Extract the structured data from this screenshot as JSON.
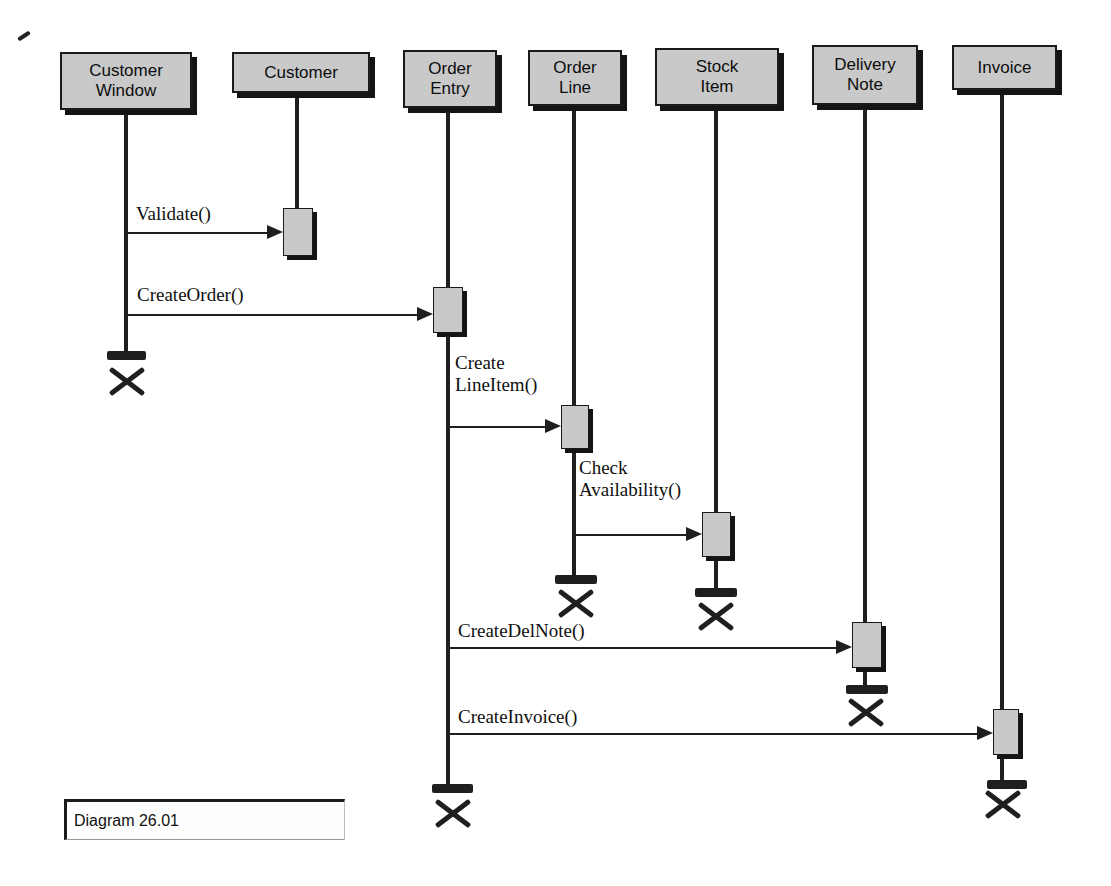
{
  "colors": {
    "line": "#1f1f1f",
    "boxfill": "#c9c9c9",
    "boxborder": "#1a1a1a",
    "shadow": "#141414"
  },
  "caption": {
    "text": "Diagram 26.01"
  },
  "actors": [
    {
      "id": "customer-window",
      "label": "Customer\nWindow",
      "box": {
        "x": 60,
        "y": 52,
        "w": 132,
        "h": 58
      },
      "lifeline": {
        "x": 126,
        "y1": 110,
        "y2": 352
      },
      "activations": [],
      "destroy": {
        "bar": {
          "x": 107,
          "y": 351,
          "w": 39,
          "h": 9
        },
        "x_mark": {
          "cx": 127,
          "cy": 382
        }
      }
    },
    {
      "id": "customer",
      "label": "Customer",
      "box": {
        "x": 232,
        "y": 52,
        "w": 138,
        "h": 41
      },
      "lifeline": {
        "x": 297,
        "y1": 93,
        "y2": 208
      },
      "activations": [
        {
          "x": 283,
          "y": 208,
          "w": 30,
          "h": 48
        }
      ],
      "destroy": null
    },
    {
      "id": "order-entry",
      "label": "Order\nEntry",
      "box": {
        "x": 403,
        "y": 50,
        "w": 94,
        "h": 58
      },
      "lifeline": {
        "x": 448,
        "y1": 108,
        "y2": 784
      },
      "activations": [
        {
          "x": 433,
          "y": 287,
          "w": 30,
          "h": 46
        }
      ],
      "destroy": {
        "bar": {
          "x": 432,
          "y": 784,
          "w": 41,
          "h": 9
        },
        "x_mark": {
          "cx": 453,
          "cy": 814
        }
      }
    },
    {
      "id": "order-line",
      "label": "Order\nLine",
      "box": {
        "x": 528,
        "y": 50,
        "w": 94,
        "h": 56
      },
      "lifeline": {
        "x": 574,
        "y1": 106,
        "y2": 575
      },
      "activations": [
        {
          "x": 561,
          "y": 405,
          "w": 28,
          "h": 44
        }
      ],
      "destroy": {
        "bar": {
          "x": 555,
          "y": 575,
          "w": 42,
          "h": 9
        },
        "x_mark": {
          "cx": 576,
          "cy": 604
        }
      }
    },
    {
      "id": "stock-item",
      "label": "Stock\nItem",
      "box": {
        "x": 655,
        "y": 48,
        "w": 124,
        "h": 58
      },
      "lifeline": {
        "x": 716,
        "y1": 106,
        "y2": 588
      },
      "activations": [
        {
          "x": 702,
          "y": 512,
          "w": 29,
          "h": 45
        }
      ],
      "destroy": {
        "bar": {
          "x": 695,
          "y": 588,
          "w": 42,
          "h": 9
        },
        "x_mark": {
          "cx": 716,
          "cy": 617
        }
      }
    },
    {
      "id": "delivery-note",
      "label": "Delivery\nNote",
      "box": {
        "x": 812,
        "y": 45,
        "w": 106,
        "h": 60
      },
      "lifeline": {
        "x": 865,
        "y1": 105,
        "y2": 685
      },
      "activations": [
        {
          "x": 852,
          "y": 622,
          "w": 30,
          "h": 46
        }
      ],
      "destroy": {
        "bar": {
          "x": 846,
          "y": 685,
          "w": 42,
          "h": 9
        },
        "x_mark": {
          "cx": 866,
          "cy": 713
        }
      }
    },
    {
      "id": "invoice",
      "label": "Invoice",
      "box": {
        "x": 952,
        "y": 45,
        "w": 105,
        "h": 45
      },
      "lifeline": {
        "x": 1002,
        "y1": 90,
        "y2": 780
      },
      "activations": [
        {
          "x": 993,
          "y": 709,
          "w": 26,
          "h": 46
        }
      ],
      "destroy": {
        "bar": {
          "x": 987,
          "y": 780,
          "w": 40,
          "h": 9
        },
        "x_mark": {
          "cx": 1003,
          "cy": 805
        }
      }
    }
  ],
  "messages": [
    {
      "id": "validate",
      "label": "Validate()",
      "from": "customer-window",
      "to": "customer",
      "x1": 128,
      "x2": 283,
      "y": 233,
      "label_x": 136,
      "label_y": 203
    },
    {
      "id": "create-order",
      "label": "CreateOrder()",
      "from": "customer-window",
      "to": "order-entry",
      "x1": 128,
      "x2": 433,
      "y": 315,
      "label_x": 137,
      "label_y": 284
    },
    {
      "id": "create-line-item",
      "label": "Create\nLineItem()",
      "from": "order-entry",
      "to": "order-line",
      "x1": 450,
      "x2": 561,
      "y": 427,
      "label_x": 455,
      "label_y": 352
    },
    {
      "id": "check-availability",
      "label": "Check\nAvailability()",
      "from": "order-line",
      "to": "stock-item",
      "x1": 576,
      "x2": 702,
      "y": 535,
      "label_x": 579,
      "label_y": 457
    },
    {
      "id": "create-del-note",
      "label": "CreateDelNote()",
      "from": "order-entry",
      "to": "delivery-note",
      "x1": 450,
      "x2": 852,
      "y": 648,
      "label_x": 458,
      "label_y": 620
    },
    {
      "id": "create-invoice",
      "label": "CreateInvoice()",
      "from": "order-entry",
      "to": "invoice",
      "x1": 450,
      "x2": 993,
      "y": 734,
      "label_x": 458,
      "label_y": 706
    }
  ]
}
